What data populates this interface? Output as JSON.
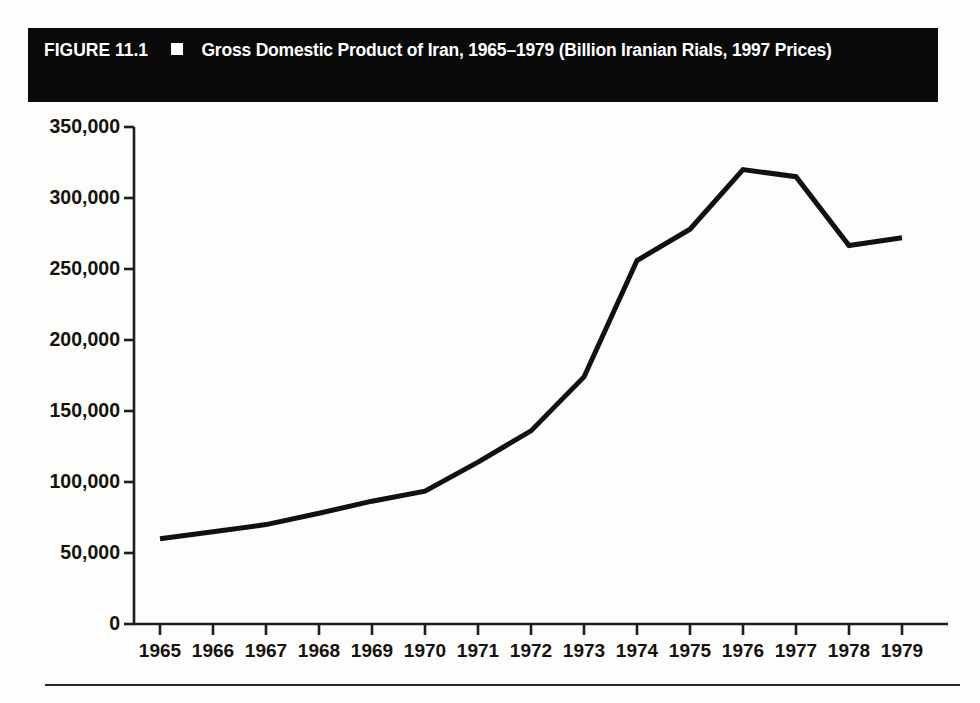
{
  "figure": {
    "label": "FIGURE 11.1",
    "marker": "white-square-bullet",
    "caption": "Gross Domestic Product of Iran, 1965–1979 (Billion Iranian Rials, 1997 Prices)",
    "title_bar_color": "#0a0a0a",
    "title_text_color": "#ffffff",
    "line_color": "#111111",
    "axis_color": "#201c19",
    "background_color": "#fdfdfb"
  },
  "chart_data": {
    "type": "line",
    "title": "Gross Domestic Product of Iran, 1965–1979 (Billion Iranian Rials, 1997 Prices)",
    "xlabel": "",
    "ylabel": "",
    "x": [
      1965,
      1966,
      1967,
      1968,
      1969,
      1970,
      1971,
      1972,
      1973,
      1974,
      1975,
      1976,
      1977,
      1978,
      1979
    ],
    "xtick_labels": [
      "1965",
      "1966",
      "1967",
      "1968",
      "1969",
      "1970",
      "1971",
      "1972",
      "1973",
      "1974",
      "1975",
      "1976",
      "1977",
      "1978",
      "1979"
    ],
    "values": [
      60000,
      65000,
      70000,
      78000,
      86500,
      93500,
      114000,
      136000,
      174000,
      256000,
      278000,
      320000,
      315000,
      266500,
      272000
    ],
    "series": [
      {
        "name": "Gross Domestic Product",
        "values": [
          60000,
          65000,
          70000,
          78000,
          86500,
          93500,
          114000,
          136000,
          174000,
          256000,
          278000,
          320000,
          315000,
          266500,
          272000
        ]
      }
    ],
    "ylim": [
      0,
      350000
    ],
    "xlim": [
      1965,
      1979
    ],
    "ytick_values": [
      0,
      50000,
      100000,
      150000,
      200000,
      250000,
      300000,
      350000
    ],
    "ytick_labels": [
      "0",
      "50,000",
      "100,000",
      "150,000",
      "200,000",
      "250,000",
      "300,000",
      "350,000"
    ],
    "grid": false,
    "legend": false,
    "legend_position": "none",
    "units": "Billion Iranian Rials (1997 Prices)"
  }
}
